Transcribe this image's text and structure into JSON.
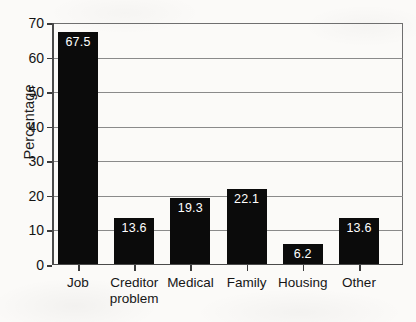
{
  "chart_data": {
    "type": "bar",
    "title": "",
    "xlabel": "",
    "ylabel": "Percentage",
    "categories": [
      "Job",
      "Creditor problem",
      "Medical",
      "Family",
      "Housing",
      "Other"
    ],
    "category_lines": [
      [
        "Job"
      ],
      [
        "Creditor",
        "problem"
      ],
      [
        "Medical"
      ],
      [
        "Family"
      ],
      [
        "Housing"
      ],
      [
        "Other"
      ]
    ],
    "values": [
      67.5,
      13.6,
      19.3,
      22.1,
      6.2,
      13.6
    ],
    "value_labels": [
      "67.5",
      "13.6",
      "19.3",
      "22.1",
      "6.2",
      "13.6"
    ],
    "ylim": [
      0,
      70
    ],
    "ytick_values": [
      0,
      10,
      20,
      30,
      40,
      50,
      60,
      70
    ],
    "ytick_labels": [
      "0",
      "10",
      "20",
      "30",
      "40",
      "50",
      "60",
      "70"
    ],
    "grid": true,
    "legend": "none",
    "bar_color": "#0b0b0b",
    "value_label_color": "#ffffff",
    "background_color": "#fbfaf8",
    "axis_color": "#3a3a3a",
    "grid_color": "#8a8a8a"
  }
}
